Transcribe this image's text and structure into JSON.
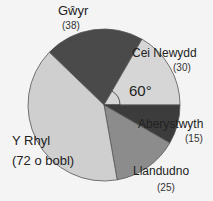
{
  "chart_data": {
    "type": "pie",
    "title": "",
    "unit": "bobl",
    "total": 180,
    "categories": [
      "Gŵyr",
      "Cei Newydd",
      "Aberystwyth",
      "Llandudno",
      "Y Rhyl"
    ],
    "values": [
      38,
      30,
      15,
      25,
      72
    ],
    "colors": [
      "#4a4a4a",
      "#d6d6d6",
      "#3c3c3c",
      "#8c8c8c",
      "#cfcfcf"
    ],
    "annotations": [
      {
        "text": "60°",
        "target": "Cei Newydd",
        "type": "angle"
      }
    ],
    "value_labels": [
      "(38)",
      "(30)",
      "(15)",
      "(25)",
      "(72 o bobl)"
    ]
  },
  "labels": {
    "gwyr": "Gŵyr",
    "gwyr_val": "(38)",
    "cei": "Cei Newydd",
    "cei_val": "(30)",
    "aber": "Aberystwyth",
    "aber_val": "(15)",
    "llan": "Llandudno",
    "llan_val": "(25)",
    "rhyl": "Y Rhyl",
    "rhyl_val": "(72 o bobl)",
    "angle": "60°"
  }
}
